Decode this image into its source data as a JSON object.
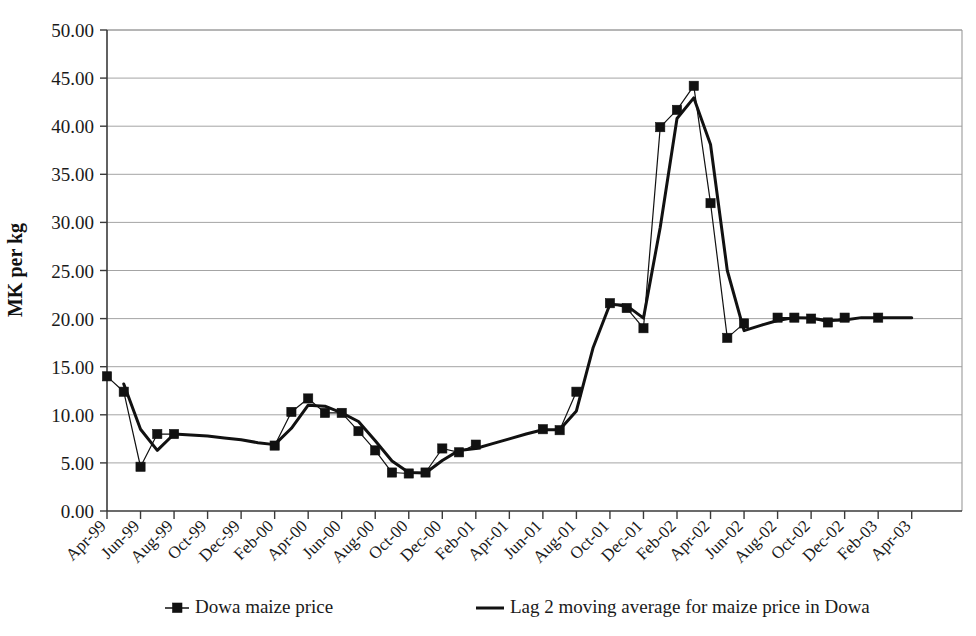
{
  "chart_data": {
    "type": "line",
    "title": "",
    "xlabel": "",
    "ylabel": "MK per kg",
    "ylim": [
      0,
      50
    ],
    "ytick_step": 5,
    "grid": true,
    "legend_position": "bottom",
    "ytick_labels": [
      "0.00",
      "5.00",
      "10.00",
      "15.00",
      "20.00",
      "25.00",
      "30.00",
      "35.00",
      "40.00",
      "45.00",
      "50.00"
    ],
    "ytick_values": [
      0,
      5,
      10,
      15,
      20,
      25,
      30,
      35,
      40,
      45,
      50
    ],
    "xtick_labels": [
      "Apr-99",
      "Jun-99",
      "Aug-99",
      "Oct-99",
      "Dec-99",
      "Feb-00",
      "Apr-00",
      "Jun-00",
      "Aug-00",
      "Oct-00",
      "Dec-00",
      "Feb-01",
      "Apr-01",
      "Jun-01",
      "Aug-01",
      "Oct-01",
      "Dec-01",
      "Feb-02",
      "Apr-02",
      "Jun-02",
      "Aug-02",
      "Oct-02",
      "Dec-02",
      "Feb-03",
      "Apr-03"
    ],
    "x": [
      "Apr-99",
      "May-99",
      "Jun-99",
      "Jul-99",
      "Aug-99",
      "Sep-99",
      "Oct-99",
      "Nov-99",
      "Dec-99",
      "Jan-00",
      "Feb-00",
      "Mar-00",
      "Apr-00",
      "May-00",
      "Jun-00",
      "Jul-00",
      "Aug-00",
      "Sep-00",
      "Oct-00",
      "Nov-00",
      "Dec-00",
      "Jan-01",
      "Feb-01",
      "Mar-01",
      "Apr-01",
      "May-01",
      "Jun-01",
      "Jul-01",
      "Aug-01",
      "Sep-01",
      "Oct-01",
      "Nov-01",
      "Dec-01",
      "Jan-02",
      "Feb-02",
      "Mar-02",
      "Apr-02",
      "May-02",
      "Jun-02",
      "Jul-02",
      "Aug-02",
      "Sep-02",
      "Oct-02",
      "Nov-02",
      "Dec-02",
      "Jan-03",
      "Feb-03",
      "Mar-03",
      "Apr-03"
    ],
    "series": [
      {
        "name": "Dowa maize price",
        "marker": "square",
        "line_width": "thin",
        "values": [
          14.0,
          12.4,
          4.6,
          8.0,
          8.0,
          null,
          null,
          null,
          null,
          null,
          6.8,
          10.3,
          11.7,
          10.2,
          10.2,
          8.3,
          6.3,
          4.0,
          3.9,
          4.0,
          6.5,
          6.1,
          6.9,
          null,
          null,
          null,
          8.5,
          8.4,
          12.4,
          null,
          21.6,
          21.1,
          19.0,
          39.9,
          41.7,
          44.2,
          32.0,
          18.0,
          19.5,
          null,
          20.1,
          20.1,
          20.0,
          19.6,
          20.1,
          null,
          20.1,
          null,
          null
        ]
      },
      {
        "name": "Lag 2 moving average for maize price in Dowa",
        "marker": "none",
        "line_width": "thick",
        "values": [
          null,
          13.2,
          8.5,
          6.3,
          8.0,
          7.9,
          7.8,
          7.6,
          7.4,
          7.1,
          6.9,
          8.6,
          11.0,
          10.9,
          10.2,
          9.3,
          7.3,
          5.2,
          4.0,
          3.95,
          5.25,
          6.3,
          6.5,
          7.0,
          7.5,
          8.0,
          8.45,
          8.45,
          10.4,
          17.0,
          21.5,
          21.35,
          20.05,
          29.5,
          40.8,
          42.95,
          38.1,
          25.0,
          18.75,
          19.3,
          19.8,
          20.1,
          20.05,
          19.8,
          19.85,
          20.1,
          20.1,
          20.1,
          20.1
        ]
      }
    ]
  },
  "legend": {
    "items": [
      {
        "label": "Dowa maize price",
        "style": "marker-line"
      },
      {
        "label": "Lag 2 moving average for maize price in Dowa",
        "style": "line"
      }
    ]
  },
  "axis": {
    "y_title": "MK per kg"
  }
}
